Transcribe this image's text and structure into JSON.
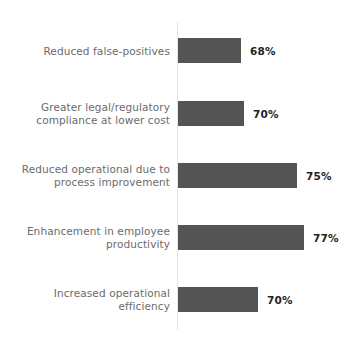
{
  "chart_data": {
    "type": "bar",
    "orientation": "horizontal",
    "title": "",
    "subtitle": "",
    "xlabel": "",
    "ylabel": "",
    "grid": false,
    "legend": false,
    "legend_position": "none",
    "value_suffix": "%",
    "xlim": [
      0,
      100
    ],
    "categories": [
      "Reduced false-positives",
      "Greater legal/regulatory\ncompliance at lower cost",
      "Reduced operational due to\nprocess improvement",
      "Enhancement in employee\nproductivity",
      "Increased operational\nefficiency"
    ],
    "values": [
      68,
      70,
      75,
      77,
      70
    ],
    "value_labels": [
      "68%",
      "70%",
      "75%",
      "77%",
      "70%"
    ],
    "bars": [
      {
        "label": "Reduced false-positives",
        "value": 68,
        "value_label": "68%",
        "bar_px": 63,
        "top_px": 38
      },
      {
        "label": "Greater legal/regulatory\ncompliance at lower cost",
        "value": 70,
        "value_label": "70%",
        "bar_px": 66,
        "top_px": 101
      },
      {
        "label": "Reduced operational due to\nprocess improvement",
        "value": 75,
        "value_label": "75%",
        "bar_px": 119,
        "top_px": 163
      },
      {
        "label": "Enhancement in employee\nproductivity",
        "value": 77,
        "value_label": "77%",
        "bar_px": 126,
        "top_px": 225
      },
      {
        "label": "Increased operational\nefficiency",
        "value": 70,
        "value_label": "70%",
        "bar_px": 80,
        "top_px": 287
      }
    ],
    "colors": {
      "bar_fill": "#545454",
      "background": "#ffffff",
      "axis_line": "#e2e2e2",
      "category_label": "#6b6b6b",
      "value_label": "#1f1f1f"
    }
  }
}
